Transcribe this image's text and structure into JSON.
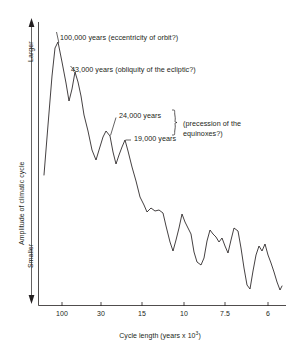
{
  "chart_data": {
    "type": "line",
    "title": "",
    "xlabel": "Cycle length (years x 10³)",
    "ylabel": "Amplitude of climatic cycle",
    "y_top_label": "Larger",
    "y_bottom_label": "Smaller",
    "x_tick_labels": [
      "100",
      "30",
      "15",
      "10",
      "7.5",
      "6"
    ],
    "x_tick_positions_px": [
      62,
      101,
      142,
      184,
      225,
      268
    ],
    "grid": false,
    "legend": null,
    "axis_note": "x axis is non-linear (period scale, decreasing left to right); y axis unlabelled amplitude",
    "annotations": [
      {
        "text": "100,000 years (eccentricity of orbit?)",
        "peak_period_ka": 100,
        "x_px": 60,
        "y_px": 38
      },
      {
        "text": "43,000 years (obliquity of the ecliptic?)",
        "peak_period_ka": 43,
        "x_px": 70,
        "y_px": 70
      },
      {
        "text": "24,000 years",
        "peak_period_ka": 24,
        "x_px": 118,
        "y_px": 116
      },
      {
        "text": "19,000 years",
        "peak_period_ka": 19,
        "x_px": 133,
        "y_px": 140
      },
      {
        "text": "(precession of the equinoxes?)",
        "x_px": 187,
        "y_px": 125
      }
    ],
    "points_px": [
      [
        44,
        175
      ],
      [
        48,
        125
      ],
      [
        52,
        76
      ],
      [
        55,
        48
      ],
      [
        58,
        42
      ],
      [
        62,
        62
      ],
      [
        66,
        83
      ],
      [
        69,
        101
      ],
      [
        72,
        89
      ],
      [
        75,
        72
      ],
      [
        78,
        82
      ],
      [
        81,
        96
      ],
      [
        84,
        115
      ],
      [
        88,
        131
      ],
      [
        92,
        150
      ],
      [
        96,
        160
      ],
      [
        99,
        150
      ],
      [
        103,
        137
      ],
      [
        106,
        131
      ],
      [
        110,
        136
      ],
      [
        113,
        152
      ],
      [
        116,
        164
      ],
      [
        119,
        155
      ],
      [
        122,
        147
      ],
      [
        125,
        140
      ],
      [
        128,
        151
      ],
      [
        132,
        167
      ],
      [
        136,
        181
      ],
      [
        140,
        197
      ],
      [
        144,
        205
      ],
      [
        147,
        212
      ],
      [
        151,
        208
      ],
      [
        155,
        211
      ],
      [
        159,
        210
      ],
      [
        163,
        213
      ],
      [
        166,
        226
      ],
      [
        170,
        242
      ],
      [
        173,
        251
      ],
      [
        176,
        240
      ],
      [
        179,
        228
      ],
      [
        182,
        214
      ],
      [
        185,
        222
      ],
      [
        188,
        228
      ],
      [
        191,
        234
      ],
      [
        194,
        252
      ],
      [
        197,
        262
      ],
      [
        201,
        265
      ],
      [
        204,
        258
      ],
      [
        207,
        241
      ],
      [
        210,
        230
      ],
      [
        213,
        234
      ],
      [
        216,
        237
      ],
      [
        219,
        242
      ],
      [
        222,
        238
      ],
      [
        225,
        246
      ],
      [
        228,
        253
      ],
      [
        231,
        240
      ],
      [
        234,
        228
      ],
      [
        238,
        231
      ],
      [
        241,
        248
      ],
      [
        244,
        268
      ],
      [
        247,
        285
      ],
      [
        250,
        289
      ],
      [
        253,
        271
      ],
      [
        256,
        255
      ],
      [
        259,
        246
      ],
      [
        262,
        251
      ],
      [
        265,
        244
      ],
      [
        268,
        255
      ],
      [
        271,
        263
      ],
      [
        274,
        272
      ],
      [
        277,
        282
      ],
      [
        280,
        290
      ],
      [
        282,
        286
      ]
    ]
  },
  "axis": {
    "y_axis_arrow_top": "up-arrow",
    "y_axis_arrow_bottom": "down-arrow"
  }
}
